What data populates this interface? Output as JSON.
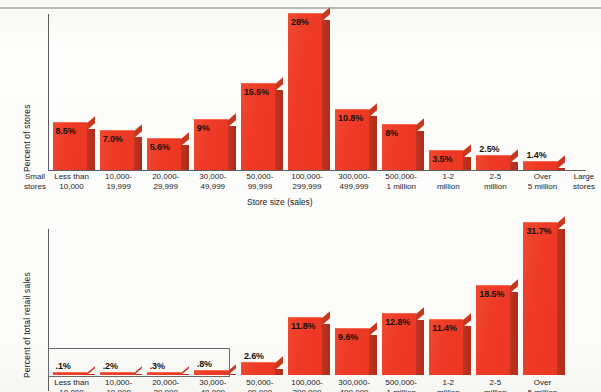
{
  "figure": {
    "top_rule": true,
    "axis_title": "Store size (sales)",
    "left_edge_label": "Small\nstores",
    "right_edge_label": "Large\nstores"
  },
  "chart_data": [
    {
      "type": "bar",
      "title": "",
      "xlabel": "Store size (sales)",
      "ylabel": "Percent of stores",
      "grid": false,
      "legend": "none",
      "ylim": [
        0,
        30
      ],
      "categories": [
        "Less than\n10,000",
        "10,000-\n19,999",
        "20,000-\n29,999",
        "30,000-\n49,999",
        "50,000-\n99,999",
        "100,000-\n299,999",
        "300,000-\n499,999",
        "500,000-\n1 million",
        "1-2\nmillion",
        "2-5\nmillion",
        "Over\n5 million"
      ],
      "values": [
        8.5,
        7.0,
        5.6,
        9,
        15.5,
        28,
        10.8,
        8,
        3.5,
        2.5,
        1.4
      ],
      "data_labels": [
        "8.5%",
        "7.0%",
        "5.6%",
        "9%",
        "15.5%",
        "28%",
        "10.8%",
        "8%",
        "3.5%",
        "2.5%",
        "1.4%"
      ]
    },
    {
      "type": "bar",
      "title": "",
      "xlabel": "Store size (sales)",
      "ylabel": "Percent of total retail sales",
      "grid": false,
      "legend": "none",
      "ylim": [
        0,
        34
      ],
      "categories": [
        "Less than\n10,000",
        "10,000-\n19,999",
        "20,000-\n29,999",
        "30,000-\n49,999",
        "50,000-\n99,999",
        "100,000-\n299,999",
        "300,000-\n499,999",
        "500,000-\n1 million",
        "1-2\nmillion",
        "2-5\nmillion",
        "Over\n5 million"
      ],
      "values": [
        0.1,
        0.2,
        0.3,
        0.8,
        2.6,
        11.8,
        9.6,
        12.8,
        11.4,
        18.5,
        31.7
      ],
      "data_labels": [
        ".1%",
        ".2%",
        ".3%",
        ".8%",
        "2.6%",
        "11.8%",
        "9.6%",
        "12.8%",
        "11.4%",
        "18.5%",
        "31.7%"
      ],
      "annotation": "inset box encloses the first four very small bars"
    }
  ],
  "top_chart": {
    "ylabel": "Percent of stores",
    "bars": [
      {
        "label": ".",
        "value_label": "8.5%"
      },
      {
        "label": ".",
        "value_label": "7.0%"
      },
      {
        "label": ".",
        "value_label": "5.6%"
      },
      {
        "label": ".",
        "value_label": "9%"
      },
      {
        "label": ".",
        "value_label": "15.5%"
      },
      {
        "label": ".",
        "value_label": "28%"
      },
      {
        "label": ".",
        "value_label": "10.8%"
      },
      {
        "label": ".",
        "value_label": "8%"
      },
      {
        "label": ".",
        "value_label": "3.5%"
      },
      {
        "label": ".",
        "value_label": "2.5%"
      },
      {
        "label": ".",
        "value_label": "1.4%"
      }
    ],
    "ticks": [
      "Less than\n10,000",
      "10,000-\n19,999",
      "20,000-\n29,999",
      "30,000-\n49,999",
      "50,000-\n99,999",
      "100,000-\n299,999",
      "300,000-\n499,999",
      "500,000-\n1 million",
      "1-2\nmillion",
      "2-5\nmillion",
      "Over\n5 million"
    ]
  },
  "bottom_chart": {
    "ylabel": "Percent of total retail sales",
    "value_labels": [
      ".1%",
      ".2%",
      ".3%",
      ".8%",
      "2.6%",
      "11.8%",
      "9.6%",
      "12.8%",
      "11.4%",
      "18.5%",
      "31.7%"
    ],
    "ticks": [
      "Less than",
      "10,000-",
      "20,000-",
      "30,000-"
    ]
  }
}
